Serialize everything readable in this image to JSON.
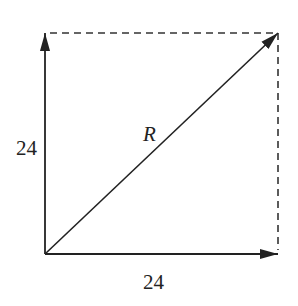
{
  "diagram": {
    "type": "vector-addition",
    "vectors": [
      {
        "name": "vertical",
        "label": "24",
        "from": [
          45,
          254
        ],
        "to": [
          45,
          33
        ]
      },
      {
        "name": "horizontal",
        "label": "24",
        "from": [
          45,
          254
        ],
        "to": [
          278,
          254
        ]
      },
      {
        "name": "resultant",
        "label": "R",
        "from": [
          45,
          254
        ],
        "to": [
          278,
          33
        ]
      }
    ],
    "dashed_edges": [
      {
        "from": [
          45,
          33
        ],
        "to": [
          278,
          33
        ]
      },
      {
        "from": [
          278,
          33
        ],
        "to": [
          278,
          254
        ]
      }
    ],
    "labels": {
      "vertical": "24",
      "horizontal": "24",
      "resultant": "R"
    },
    "colors": {
      "line": "#222222",
      "background": "#ffffff"
    }
  }
}
